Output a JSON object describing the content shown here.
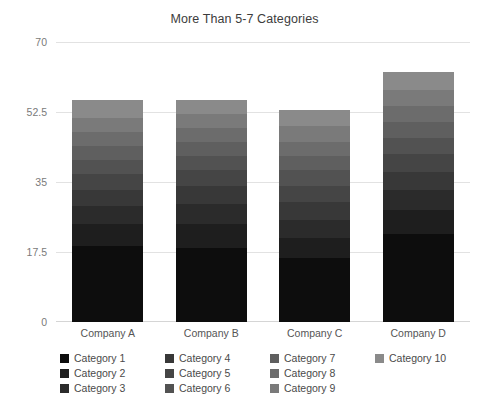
{
  "chart_data": {
    "type": "bar",
    "stacked": true,
    "title": "More Than 5-7 Categories",
    "xlabel": "",
    "ylabel": "",
    "categories": [
      "Company A",
      "Company B",
      "Company C",
      "Company D"
    ],
    "ylim": [
      0,
      70
    ],
    "yticks": [
      0,
      17.5,
      35,
      52.5,
      70
    ],
    "ytick_labels": [
      "0",
      "17.5",
      "35",
      "52.5",
      "70"
    ],
    "grid": true,
    "legend_position": "bottom",
    "legend_columns": 4,
    "series": [
      {
        "name": "Category 1",
        "color": "#0d0d0d",
        "values": [
          19.0,
          18.5,
          16.0,
          22.0
        ]
      },
      {
        "name": "Category 2",
        "color": "#1e1e1e",
        "values": [
          5.5,
          6.0,
          5.0,
          6.0
        ]
      },
      {
        "name": "Category 3",
        "color": "#2b2b2b",
        "values": [
          4.5,
          5.0,
          4.5,
          5.0
        ]
      },
      {
        "name": "Category 4",
        "color": "#383838",
        "values": [
          4.0,
          4.5,
          4.5,
          4.5
        ]
      },
      {
        "name": "Category 5",
        "color": "#454545",
        "values": [
          4.0,
          4.0,
          4.0,
          4.5
        ]
      },
      {
        "name": "Category 6",
        "color": "#525252",
        "values": [
          3.5,
          3.5,
          4.0,
          4.0
        ]
      },
      {
        "name": "Category 7",
        "color": "#5f5f5f",
        "values": [
          3.5,
          3.5,
          3.5,
          4.0
        ]
      },
      {
        "name": "Category 8",
        "color": "#6c6c6c",
        "values": [
          3.5,
          3.5,
          3.5,
          4.0
        ]
      },
      {
        "name": "Category 9",
        "color": "#7a7a7a",
        "values": [
          3.5,
          3.5,
          4.0,
          4.0
        ]
      },
      {
        "name": "Category 10",
        "color": "#8a8a8a",
        "values": [
          4.5,
          3.5,
          4.0,
          4.5
        ]
      }
    ],
    "totals": [
      55.5,
      55.5,
      53.0,
      62.5
    ]
  }
}
